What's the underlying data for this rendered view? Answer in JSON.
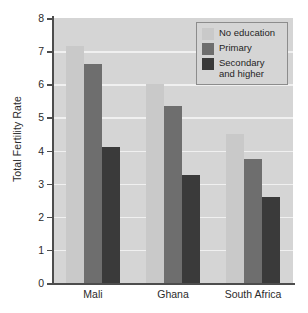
{
  "chart_data": {
    "type": "bar",
    "title": "",
    "subtitle": "",
    "xlabel": "",
    "ylabel": "Total Fertility Rate",
    "ylim": [
      0,
      8
    ],
    "yticks": [
      0,
      1,
      2,
      3,
      4,
      5,
      6,
      7,
      8
    ],
    "ytick_labels": [
      "0",
      "1",
      "2",
      "3",
      "4",
      "5",
      "6",
      "7",
      "8"
    ],
    "grid": true,
    "grid_axis": "y",
    "legend_position": "top-right",
    "categories": [
      "Mali",
      "Ghana",
      "South Africa"
    ],
    "series": [
      {
        "name": "No education",
        "color": "#c9c9c9",
        "values": [
          7.15,
          6.0,
          4.5
        ]
      },
      {
        "name": "Primary",
        "color": "#6e6e6e",
        "values": [
          6.6,
          5.35,
          3.75
        ]
      },
      {
        "name": "Secondary and higher",
        "color": "#3a3a3a",
        "values": [
          4.12,
          3.25,
          2.6
        ]
      }
    ],
    "legend_entries": [
      {
        "label": "No education",
        "label_line1": "No education",
        "label_line2": "",
        "color": "#c9c9c9"
      },
      {
        "label": "Primary",
        "label_line1": "Primary",
        "label_line2": "",
        "color": "#6e6e6e"
      },
      {
        "label": "Secondary and higher",
        "label_line1": "Secondary",
        "label_line2": "and higher",
        "color": "#3a3a3a"
      }
    ],
    "annotations": [],
    "plot_background": "#d5d5d5",
    "figure_background": "#ffffff",
    "axis_color": "#4d4d4d",
    "gridline_color": "#f0f0f0"
  }
}
